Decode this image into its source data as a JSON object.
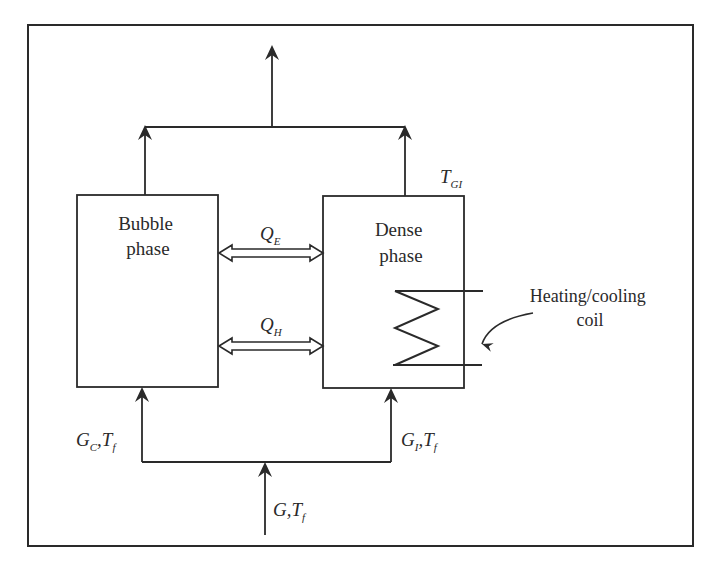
{
  "diagram": {
    "type": "two-phase fluidized bed model schematic",
    "colors": {
      "stroke": "#2a2a2a",
      "background": "#ffffff"
    },
    "boxes": [
      {
        "id": "bubble",
        "label_lines": [
          "Bubble",
          "phase"
        ]
      },
      {
        "id": "dense",
        "label_lines": [
          "Dense",
          "phase"
        ]
      }
    ],
    "exchange_arrows": [
      {
        "id": "qe",
        "symbol": "Q",
        "subscript": "E"
      },
      {
        "id": "qh",
        "symbol": "Q",
        "subscript": "H"
      }
    ],
    "stream_labels": {
      "outlet_temp": {
        "symbol": "T",
        "subscript": "GI"
      },
      "bubble_inlet": {
        "g": "G",
        "g_sub": "C",
        "t": "T",
        "t_sub": "f"
      },
      "dense_inlet": {
        "g": "G",
        "g_sub": "I",
        "t": "T",
        "t_sub": "f"
      },
      "feed": {
        "g": "G",
        "t": "T",
        "t_sub": "f"
      }
    },
    "annotation": {
      "lines": [
        "Heating/cooling",
        "coil"
      ]
    },
    "separator": ","
  }
}
